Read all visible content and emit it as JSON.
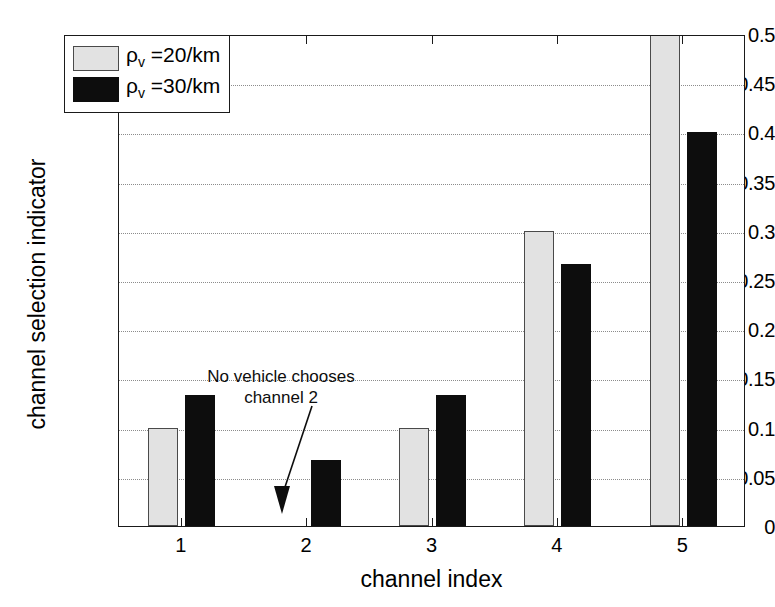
{
  "chart_data": {
    "type": "bar",
    "title": "",
    "xlabel": "channel index",
    "ylabel": "channel selection indicator",
    "categories": [
      "1",
      "2",
      "3",
      "4",
      "5"
    ],
    "series": [
      {
        "name": "rho_v=20/km",
        "label": "ρ",
        "sub": "v",
        "suffix": " =20/km",
        "color": "#e2e2e2",
        "values": [
          0.1,
          0,
          0.1,
          0.3,
          0.5
        ]
      },
      {
        "name": "rho_v=30/km",
        "label": "ρ",
        "sub": "v",
        "suffix": " =30/km",
        "color": "#0d0d0d",
        "values": [
          0.1333,
          0.0667,
          0.1333,
          0.2667,
          0.4
        ]
      }
    ],
    "ylim": [
      0,
      0.5
    ],
    "yticks": [
      "0",
      "0.05",
      "0.1",
      "0.15",
      "0.2",
      "0.25",
      "0.3",
      "0.35",
      "0.4",
      "0.45",
      "0.5"
    ],
    "ytick_values": [
      0,
      0.05,
      0.1,
      0.15,
      0.2,
      0.25,
      0.3,
      0.35,
      0.4,
      0.45,
      0.5
    ],
    "grid": true,
    "legend_position": "upper-left-inside",
    "annotations": [
      {
        "text_line1": "No vehicle chooses",
        "text_line2": "channel 2",
        "points_to_category": "2"
      }
    ]
  },
  "axis": {
    "y_title": "channel selection indicator",
    "x_title": "channel index",
    "y_tick_labels": [
      "0.5",
      "0.45",
      "0.4",
      "0.35",
      "0.3",
      "0.25",
      "0.2",
      "0.15",
      "0.1",
      "0.05",
      "0"
    ],
    "x_tick_labels": [
      "1",
      "2",
      "3",
      "4",
      "5"
    ]
  },
  "legend": {
    "items": [
      {
        "symbol": "ρ",
        "subscript": "v",
        "text": " =20/km",
        "swatch": "light"
      },
      {
        "symbol": "ρ",
        "subscript": "v",
        "text": " =30/km",
        "swatch": "dark"
      }
    ]
  },
  "annotation": {
    "line1": "No vehicle chooses",
    "line2": "channel 2"
  },
  "colors": {
    "light_bar": "#e2e2e2",
    "dark_bar": "#0d0d0d",
    "axis": "#1a1a1a",
    "grid": "#8c8c8c",
    "background": "#ffffff"
  }
}
